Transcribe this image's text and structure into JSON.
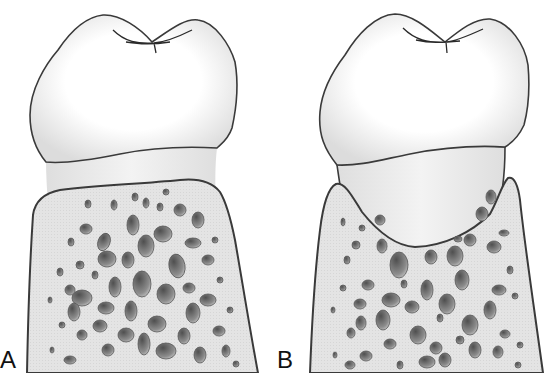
{
  "figure": {
    "type": "dental anatomy illustration",
    "panels": [
      {
        "label": "A",
        "description": "Tooth with normal alveolar bone crest level below the cementoenamel junction",
        "parts": [
          "crown (enamel)",
          "root surface (cementum band)",
          "alveolar bone with trabecular marrow spaces"
        ]
      },
      {
        "label": "B",
        "description": "Tooth with bone loss forming a crater / angular defect exposing more root surface",
        "parts": [
          "crown (enamel)",
          "exposed root surface",
          "alveolar bone with interdental peaks and vertical defect"
        ]
      }
    ]
  },
  "colors": {
    "outline": "#3a3a3a",
    "crown_fill": "#ffffff",
    "crown_shade": "#e6e6e6",
    "root_fill": "#ededed",
    "bone_fill": "#e2e2e2",
    "marrow_dark": "#6a6a6a",
    "marrow_light": "#bdbdbd",
    "background": "#ffffff"
  }
}
